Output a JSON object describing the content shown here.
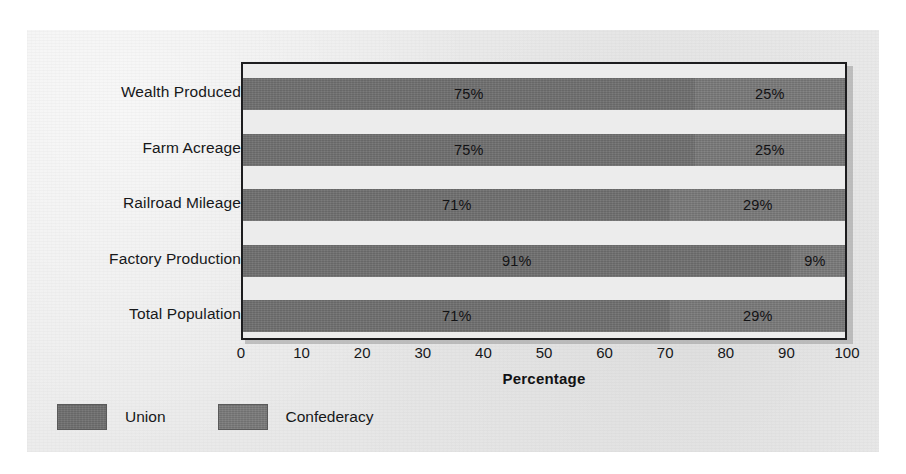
{
  "chart_data": {
    "type": "bar",
    "orientation": "horizontal",
    "stacked": true,
    "title": "",
    "xlabel": "Percentage",
    "ylabel": "",
    "xlim": [
      0,
      100
    ],
    "xticks": [
      0,
      10,
      20,
      30,
      40,
      50,
      60,
      70,
      80,
      90,
      100
    ],
    "xtick_labels": [
      "0",
      "10",
      "20",
      "30",
      "40",
      "50",
      "60",
      "70",
      "80",
      "90",
      "100"
    ],
    "grid": false,
    "legend_position": "below-left",
    "categories": [
      "Wealth Produced",
      "Farm Acreage",
      "Railroad Mileage",
      "Factory Production",
      "Total Population"
    ],
    "series": [
      {
        "name": "Union",
        "color": "#6f6f6f",
        "values": [
          75,
          75,
          71,
          91,
          71
        ],
        "data_labels": [
          "75%",
          "75%",
          "71%",
          "91%",
          "71%"
        ]
      },
      {
        "name": "Confederacy",
        "color": "#787878",
        "values": [
          25,
          25,
          29,
          9,
          29
        ],
        "data_labels": [
          "25%",
          "25%",
          "29%",
          "9%",
          "29%"
        ]
      }
    ]
  },
  "legend": {
    "items": [
      {
        "label": "Union",
        "color": "#6f6f6f"
      },
      {
        "label": "Confederacy",
        "color": "#787878"
      }
    ]
  },
  "colors": {
    "page_background": "#eaeaea",
    "plot_background": "#ececec",
    "frame": "#1d1d1f",
    "text": "#17181a",
    "union": "#6f6f6f",
    "confederacy": "#787878"
  }
}
